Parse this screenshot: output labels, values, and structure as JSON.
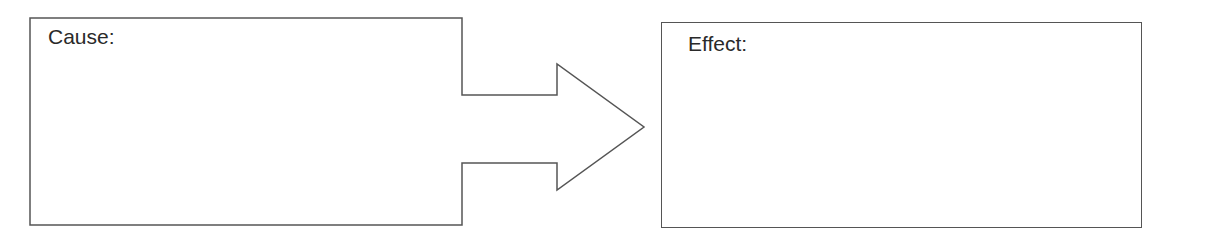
{
  "diagram": {
    "cause": {
      "label": "Cause:"
    },
    "effect": {
      "label": "Effect:"
    },
    "arrow": {
      "direction": "right",
      "from": "cause",
      "to": "effect"
    },
    "colors": {
      "stroke": "#555555",
      "text": "#2a2a2a",
      "background": "#ffffff"
    }
  }
}
